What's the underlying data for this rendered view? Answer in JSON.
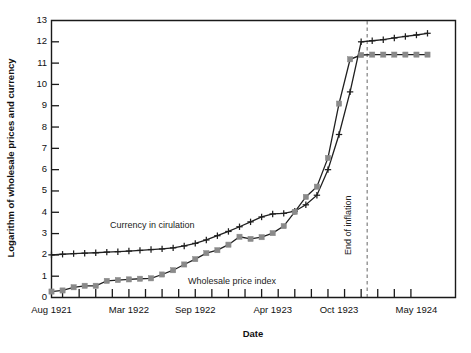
{
  "chart_data": {
    "type": "line",
    "title": "",
    "xlabel": "Date",
    "ylabel": "Logarithm of wholesale prices and currency",
    "ylim": [
      0,
      13
    ],
    "yticks": [
      0,
      1,
      2,
      3,
      4,
      5,
      6,
      7,
      8,
      9,
      10,
      11,
      12,
      13
    ],
    "xtick_labels": [
      "Aug 1921",
      "Mar 1922",
      "Sep 1922",
      "Apr 1923",
      "Oct 1923",
      "May 1924"
    ],
    "xtick_positions": [
      0,
      7,
      13,
      20,
      26,
      33
    ],
    "grid": false,
    "legend_position": "inline-annotation",
    "x": [
      0,
      1,
      2,
      3,
      4,
      5,
      6,
      7,
      8,
      9,
      10,
      11,
      12,
      13,
      14,
      15,
      16,
      17,
      18,
      19,
      20,
      21,
      22,
      23,
      24,
      25,
      26,
      27,
      28,
      29,
      30,
      31,
      32,
      33,
      34
    ],
    "series": [
      {
        "name": "Currency in cirulation",
        "marker": "plus",
        "color": "#1f1f1f",
        "values": [
          2.0,
          2.03,
          2.06,
          2.08,
          2.1,
          2.13,
          2.15,
          2.18,
          2.21,
          2.25,
          2.28,
          2.33,
          2.42,
          2.54,
          2.7,
          2.9,
          3.1,
          3.32,
          3.55,
          3.78,
          3.92,
          3.95,
          4.05,
          4.35,
          4.8,
          6.0,
          7.65,
          9.65,
          12.0,
          12.05,
          12.1,
          12.18,
          12.25,
          12.32,
          12.4
        ]
      },
      {
        "name": "Wholesale price index",
        "marker": "square",
        "color": "#8a8a8a",
        "values": [
          0.28,
          0.33,
          0.48,
          0.55,
          0.55,
          0.78,
          0.82,
          0.85,
          0.88,
          0.9,
          1.08,
          1.28,
          1.55,
          1.8,
          2.08,
          2.22,
          2.48,
          2.85,
          2.75,
          2.83,
          3.02,
          3.35,
          4.02,
          4.72,
          5.2,
          6.55,
          9.1,
          11.18,
          11.38,
          11.4,
          11.4,
          11.4,
          11.4,
          11.4,
          11.4
        ]
      }
    ],
    "annotations": [
      {
        "name": "currency-label",
        "text": "Currency in cirulation",
        "x_px": 110,
        "y_px": 228
      },
      {
        "name": "wholesale-label",
        "text": "Wholesale price index",
        "x_px": 188,
        "y_px": 284
      },
      {
        "name": "end-of-inflation-label",
        "text": "End of inflation",
        "x_px": 351,
        "y_px": 255,
        "rotated": true
      }
    ],
    "vline": {
      "label": "End of inflation",
      "x_index": 28
    }
  }
}
